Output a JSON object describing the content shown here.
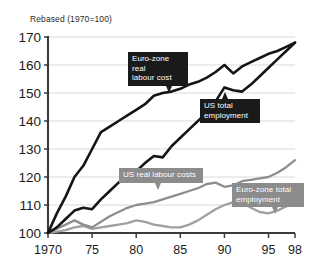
{
  "chart_data": {
    "type": "line",
    "title": "Rebased (1970=100)",
    "xlabel": "",
    "ylabel": "",
    "xlim": [
      1970,
      1998
    ],
    "ylim": [
      100,
      170
    ],
    "grid": true,
    "legend": "inline-callouts",
    "x_ticks": [
      "1970",
      "75",
      "80",
      "85",
      "90",
      "95",
      "98"
    ],
    "x_tick_values": [
      1970,
      1975,
      1980,
      1985,
      1990,
      1995,
      1998
    ],
    "y_ticks": [
      "100",
      "110",
      "120",
      "130",
      "140",
      "150",
      "160",
      "170"
    ],
    "y_tick_values": [
      100,
      110,
      120,
      130,
      140,
      150,
      160,
      170
    ],
    "x": [
      1970,
      1971,
      1972,
      1973,
      1974,
      1975,
      1976,
      1977,
      1978,
      1979,
      1980,
      1981,
      1982,
      1983,
      1984,
      1985,
      1986,
      1987,
      1988,
      1989,
      1990,
      1991,
      1992,
      1993,
      1994,
      1995,
      1996,
      1997,
      1998
    ],
    "series": [
      {
        "name": "Euro-zone real labour cost",
        "color": "#151515",
        "style": "thick-black",
        "values": [
          100,
          107,
          113,
          120,
          124,
          130,
          136,
          138,
          140,
          142,
          144,
          146,
          149,
          150,
          150.5,
          151.5,
          153,
          154,
          155.5,
          157.5,
          160,
          157,
          159.5,
          161,
          162.5,
          164,
          165,
          166.5,
          168
        ]
      },
      {
        "name": "US total employment",
        "color": "#151515",
        "style": "thick-black",
        "values": [
          100,
          102,
          105,
          108,
          109,
          108.5,
          112,
          115,
          118,
          120,
          122,
          125,
          127.5,
          127,
          131,
          134,
          137,
          140,
          143,
          147,
          152,
          151,
          150.5,
          153,
          156,
          159,
          162,
          165,
          168
        ]
      },
      {
        "name": "US real labour costs",
        "color": "#8e8e8e",
        "style": "gray",
        "values": [
          100,
          101.5,
          103,
          104.5,
          103,
          102,
          104,
          106,
          107.5,
          109,
          110,
          110.5,
          111,
          112,
          113,
          114,
          115,
          116,
          117.5,
          118,
          116.5,
          117,
          118.5,
          119,
          119.5,
          120,
          121.5,
          123.5,
          126
        ]
      },
      {
        "name": "Euro-zone total employment",
        "color": "#a0a0a0",
        "style": "gray",
        "values": [
          100,
          100.5,
          101,
          102,
          102.5,
          101.5,
          102,
          102.5,
          103,
          103.5,
          104.5,
          104,
          103,
          102.5,
          102,
          102,
          103,
          104.5,
          106.5,
          108.5,
          110,
          111,
          111,
          109,
          107.5,
          107,
          108,
          109.5,
          111
        ]
      }
    ],
    "annotations": [
      {
        "id": "euro-zone-real-labour-cost",
        "text": "Euro-zone real\nlabour cost",
        "style": "dark"
      },
      {
        "id": "us-total-employment",
        "text": "US total\nemployment",
        "style": "dark"
      },
      {
        "id": "us-real-labour-costs",
        "text": "US real labour costs",
        "style": "gray"
      },
      {
        "id": "euro-zone-total-employment",
        "text": "Euro-zone total\nemployment",
        "style": "gray"
      }
    ]
  },
  "colors": {
    "dark_series": "#151515",
    "gray_series": "#8e8e8e",
    "gray_series_alt": "#a0a0a0",
    "gridline": "#c9c9c9",
    "axis": "#3b3b3b",
    "callout_dark_bg": "#1a1a1a",
    "callout_gray_bg": "#8c8c8c",
    "background": "#ffffff"
  }
}
